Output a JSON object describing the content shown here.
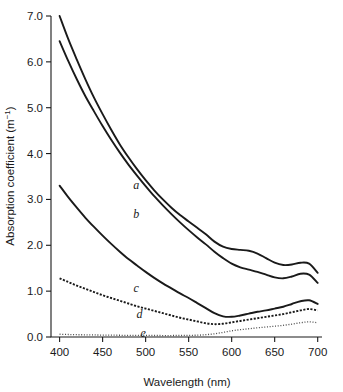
{
  "chart_data": {
    "type": "line",
    "title": "",
    "xlabel": "Wavelength (nm)",
    "ylabel_text": "Absorption coefficient (m",
    "ylabel_sup": "−1",
    "ylabel_tail": ")",
    "ylabel_full": "Absorption coefficient (m−1)",
    "xlim": [
      390,
      705
    ],
    "ylim": [
      0.0,
      7.0
    ],
    "grid": false,
    "legend": "inline curve labels a–e placed next to each curve",
    "xticks": [
      400,
      450,
      500,
      550,
      600,
      650,
      700
    ],
    "xtick_labels": [
      "400",
      "450",
      "500",
      "550",
      "600",
      "650",
      "700"
    ],
    "yticks": [
      0.0,
      1.0,
      2.0,
      3.0,
      4.0,
      5.0,
      6.0,
      7.0
    ],
    "ytick_labels": [
      "0.0",
      "1.0",
      "2.0",
      "3.0",
      "4.0",
      "5.0",
      "6.0",
      "7.0"
    ],
    "x": [
      400,
      410,
      420,
      430,
      440,
      450,
      460,
      470,
      480,
      490,
      500,
      510,
      520,
      530,
      540,
      550,
      560,
      570,
      580,
      590,
      600,
      610,
      620,
      630,
      640,
      650,
      660,
      670,
      680,
      690,
      700
    ],
    "series": [
      {
        "name": "a",
        "label": "a",
        "style": "solid",
        "label_x": 489,
        "label_y": 3.32,
        "values": [
          7.0,
          6.5,
          6.05,
          5.62,
          5.22,
          4.86,
          4.52,
          4.2,
          3.92,
          3.66,
          3.42,
          3.2,
          3.0,
          2.82,
          2.66,
          2.52,
          2.38,
          2.24,
          2.08,
          1.97,
          1.92,
          1.9,
          1.88,
          1.82,
          1.72,
          1.62,
          1.57,
          1.58,
          1.62,
          1.6,
          1.4
        ]
      },
      {
        "name": "b",
        "label": "b",
        "style": "solid",
        "label_x": 489,
        "label_y": 2.68,
        "values": [
          6.45,
          6.02,
          5.62,
          5.25,
          4.92,
          4.6,
          4.3,
          4.02,
          3.76,
          3.52,
          3.29,
          3.07,
          2.87,
          2.68,
          2.5,
          2.33,
          2.17,
          2.02,
          1.86,
          1.72,
          1.6,
          1.52,
          1.47,
          1.42,
          1.36,
          1.3,
          1.28,
          1.32,
          1.38,
          1.36,
          1.18
        ]
      },
      {
        "name": "c",
        "label": "c",
        "style": "solid",
        "label_x": 489,
        "label_y": 1.06,
        "values": [
          3.3,
          3.05,
          2.82,
          2.6,
          2.4,
          2.21,
          2.03,
          1.86,
          1.7,
          1.56,
          1.42,
          1.29,
          1.17,
          1.06,
          0.95,
          0.85,
          0.74,
          0.63,
          0.52,
          0.45,
          0.44,
          0.47,
          0.51,
          0.55,
          0.58,
          0.62,
          0.66,
          0.72,
          0.78,
          0.8,
          0.72
        ]
      },
      {
        "name": "d",
        "label": "d",
        "style": "dashed",
        "label_x": 493,
        "label_y": 0.5,
        "values": [
          1.28,
          1.2,
          1.12,
          1.05,
          0.98,
          0.91,
          0.85,
          0.79,
          0.73,
          0.67,
          0.62,
          0.57,
          0.52,
          0.47,
          0.42,
          0.38,
          0.34,
          0.3,
          0.28,
          0.29,
          0.32,
          0.35,
          0.38,
          0.41,
          0.44,
          0.47,
          0.5,
          0.54,
          0.58,
          0.61,
          0.58
        ]
      },
      {
        "name": "e",
        "label": "e",
        "style": "dotted",
        "label_x": 497,
        "label_y": 0.08,
        "values": [
          0.06,
          0.055,
          0.05,
          0.048,
          0.045,
          0.042,
          0.04,
          0.038,
          0.036,
          0.035,
          0.034,
          0.033,
          0.032,
          0.032,
          0.033,
          0.035,
          0.04,
          0.05,
          0.07,
          0.1,
          0.135,
          0.16,
          0.18,
          0.2,
          0.218,
          0.235,
          0.255,
          0.28,
          0.31,
          0.33,
          0.31
        ]
      }
    ]
  }
}
